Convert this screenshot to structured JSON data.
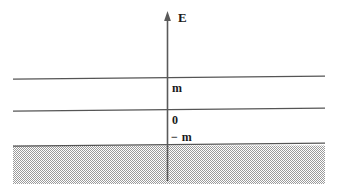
{
  "figure": {
    "background_color": "#ffffff",
    "line_color": "#4d4d4d",
    "axis_color": "#595959",
    "text_color": "#1a1a1a",
    "shading_color": "#a8a8a8",
    "axis": {
      "name": "energy-axis",
      "label": "E",
      "orientation": "vertical",
      "arrow": "up",
      "x": 167,
      "top": 14,
      "bottom": 181
    },
    "labels": {
      "energy_axis": "E",
      "positive_mass": "m",
      "zero": "0",
      "negative_mass": "− m"
    },
    "levels": [
      {
        "name": "level-positive-m",
        "label": "m",
        "value": "m",
        "y_left": 79,
        "y_right": 76
      },
      {
        "name": "level-zero",
        "label": "0",
        "value": "0",
        "y_left": 111,
        "y_right": 108
      },
      {
        "name": "level-negative-m",
        "label": "− m",
        "value": "-m",
        "y_left": 146,
        "y_right": 143
      }
    ],
    "shaded_region": {
      "name": "filled-negative-energy-sea",
      "pattern": "checkerboard-stipple",
      "x_start": 13,
      "x_end": 325,
      "y_start": 145,
      "y_end": 184
    },
    "extent": {
      "line_x_start": 13,
      "line_x_end": 325,
      "width": 338,
      "height": 191
    }
  }
}
